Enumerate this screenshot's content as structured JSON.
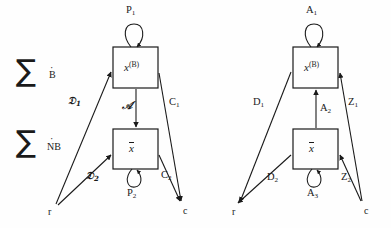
{
  "figure": {
    "background": "#fefefe",
    "stroke": "#1a1a1a"
  },
  "summations": [
    {
      "symbol": "∑",
      "subscript": "B",
      "dot": "·",
      "name": "sigma-b"
    },
    {
      "symbol": "∑",
      "subscript": "NB",
      "dot": "·",
      "name": "sigma-nb"
    }
  ],
  "diagrams": [
    {
      "id": "left",
      "nodes": {
        "top_box": {
          "base": "x",
          "sup": "(B)"
        },
        "bottom_box": {
          "base": "x",
          "overline": true
        }
      },
      "self_loops": [
        {
          "label_base": "P",
          "label_sub": "1",
          "position": "above-top-box"
        },
        {
          "label_base": "P",
          "label_sub": "2",
          "position": "below-bottom-box"
        }
      ],
      "middle_edge": {
        "label": "𝒜",
        "direction": "down"
      },
      "edges": [
        {
          "label_base": "𝔇",
          "label_sub": "1",
          "from": "r",
          "to": "top_box"
        },
        {
          "label_base": "𝔇",
          "label_sub": "2",
          "from": "r",
          "to": "bottom_box"
        },
        {
          "label_base": "C",
          "label_sub": "1",
          "from": "top_box",
          "to": "c"
        },
        {
          "label_base": "C",
          "label_sub": "2",
          "from": "bottom_box",
          "to": "c"
        }
      ],
      "terminals": {
        "left": "r",
        "right": "c"
      }
    },
    {
      "id": "right",
      "nodes": {
        "top_box": {
          "base": "x",
          "sup": "(B)"
        },
        "bottom_box": {
          "base": "x",
          "overline": true
        }
      },
      "self_loops": [
        {
          "label_base": "A",
          "label_sub": "1",
          "position": "above-top-box"
        },
        {
          "label_base": "A",
          "label_sub": "3",
          "position": "below-bottom-box"
        }
      ],
      "middle_edge": {
        "label_base": "A",
        "label_sub": "2",
        "direction": "up"
      },
      "edges": [
        {
          "label_base": "D",
          "label_sub": "1",
          "from": "top_box",
          "to": "r"
        },
        {
          "label_base": "D",
          "label_sub": "2",
          "from": "bottom_box",
          "to": "r"
        },
        {
          "label_base": "Z",
          "label_sub": "1",
          "from": "c",
          "to": "top_box"
        },
        {
          "label_base": "Z",
          "label_sub": "2",
          "from": "c",
          "to": "bottom_box"
        }
      ],
      "terminals": {
        "left": "r",
        "right": "c"
      }
    }
  ],
  "labels": {
    "left_P1": "P",
    "left_P1_sub": "1",
    "left_P2": "P",
    "left_P2_sub": "2",
    "left_D1": "𝔇",
    "left_D1_sub": "1",
    "left_D2": "𝔇",
    "left_D2_sub": "2",
    "left_C1": "C",
    "left_C1_sub": "1",
    "left_C2": "C",
    "left_C2_sub": "2",
    "left_alpha": "𝒜",
    "left_r": "r",
    "left_c": "c",
    "left_top_base": "x",
    "left_top_sup": "(B)",
    "left_bot_base": "x",
    "right_A1": "A",
    "right_A1_sub": "1",
    "right_A2": "A",
    "right_A2_sub": "2",
    "right_A3": "A",
    "right_A3_sub": "3",
    "right_D1": "D",
    "right_D1_sub": "1",
    "right_D2": "D",
    "right_D2_sub": "2",
    "right_Z1": "Z",
    "right_Z1_sub": "1",
    "right_Z2": "Z",
    "right_Z2_sub": "2",
    "right_r": "r",
    "right_c": "c",
    "right_top_base": "x",
    "right_top_sup": "(B)",
    "right_bot_base": "x"
  }
}
